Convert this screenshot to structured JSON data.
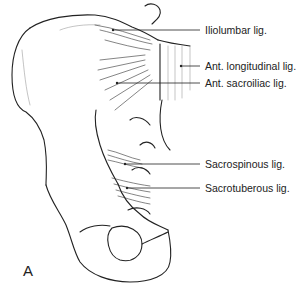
{
  "figure": {
    "panel_letter": "A",
    "labels": [
      {
        "id": "iliolumbar",
        "text": "Iliolumbar lig."
      },
      {
        "id": "ant-longitudinal",
        "text": "Ant. longitudinal lig."
      },
      {
        "id": "ant-sacroiliac",
        "text": "Ant. sacroiliac lig."
      },
      {
        "id": "sacrospinous",
        "text": "Sacrospinous lig."
      },
      {
        "id": "sacrotuberous",
        "text": "Sacrotuberous lig."
      }
    ]
  }
}
